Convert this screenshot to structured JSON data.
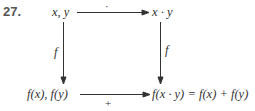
{
  "problem": {
    "number": "27."
  },
  "nodes": {
    "top_left": "x, y",
    "top_right": "x · y",
    "bottom_left": "f(x), f(y)",
    "bottom_right": "f(x · y) = f(x) + f(y)"
  },
  "edges": {
    "top": {
      "from": "top_left",
      "to": "top_right",
      "label": "·"
    },
    "left": {
      "from": "top_left",
      "to": "bottom_left",
      "label": "f"
    },
    "right": {
      "from": "top_right",
      "to": "bottom_right",
      "label": "f"
    },
    "bottom": {
      "from": "bottom_left",
      "to": "bottom_right",
      "label": "+"
    }
  },
  "colors": {
    "ink": "#333333",
    "number": "#555555"
  }
}
